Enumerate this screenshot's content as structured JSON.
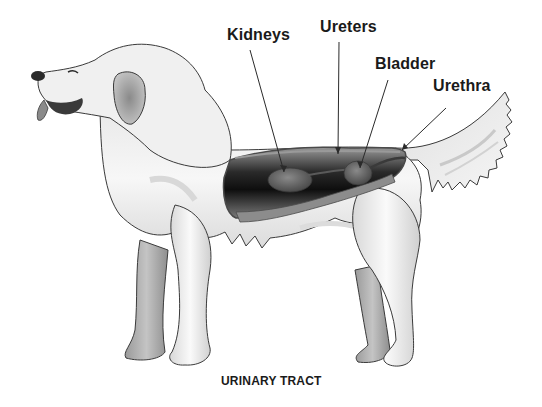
{
  "diagram": {
    "title": "URINARY TRACT",
    "labels": [
      {
        "id": "kidneys",
        "text": "Kidneys"
      },
      {
        "id": "ureters",
        "text": "Ureters"
      },
      {
        "id": "bladder",
        "text": "Bladder"
      },
      {
        "id": "urethra",
        "text": "Urethra"
      }
    ],
    "colors": {
      "background": "#ffffff",
      "outline": "#3a3a3a",
      "fur_light": "#f2f2f2",
      "fur_mid": "#cfcfcf",
      "fur_dark": "#8c8c8c",
      "cavity_dark": "#151515",
      "organ": "#6e6e6e",
      "text": "#1a1a1a"
    }
  }
}
